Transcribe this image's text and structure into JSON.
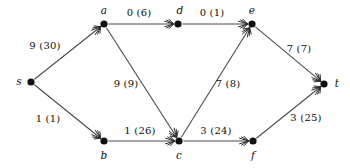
{
  "figure": {
    "kind": "flow-network-diagram",
    "width": 350,
    "height": 168,
    "background": "#ffffff",
    "line_color": "#4a4a4a",
    "node_color": "#111111",
    "text_color": "#0d0d0d"
  },
  "nodes": [
    {
      "id": "s",
      "label": "s",
      "x": 31,
      "y": 82,
      "label_x": 19,
      "label_y": 81,
      "r": 3.6
    },
    {
      "id": "a",
      "label": "a",
      "x": 104,
      "y": 24,
      "label_x": 104,
      "label_y": 10,
      "r": 3.6
    },
    {
      "id": "b",
      "label": "b",
      "x": 104,
      "y": 141,
      "label_x": 104,
      "label_y": 155,
      "r": 3.6
    },
    {
      "id": "d",
      "label": "d",
      "x": 178,
      "y": 24,
      "label_x": 180,
      "label_y": 10,
      "r": 3.6
    },
    {
      "id": "c",
      "label": "c",
      "x": 179,
      "y": 141,
      "label_x": 179,
      "label_y": 155,
      "r": 3.6
    },
    {
      "id": "e",
      "label": "e",
      "x": 252,
      "y": 24,
      "label_x": 252,
      "label_y": 10,
      "r": 3.6
    },
    {
      "id": "f",
      "label": "f",
      "x": 253,
      "y": 141,
      "label_x": 253,
      "label_y": 155,
      "r": 3.6
    },
    {
      "id": "t",
      "label": "t",
      "x": 324,
      "y": 84,
      "label_x": 337,
      "label_y": 83,
      "r": 3.6
    }
  ],
  "edges": [
    {
      "from": "s",
      "to": "a",
      "flow": 9,
      "capacity": 30,
      "label": "9 (30)",
      "label_x": 45,
      "label_y": 45
    },
    {
      "from": "s",
      "to": "b",
      "flow": 1,
      "capacity": 1,
      "label": "1 (1)",
      "label_x": 48,
      "label_y": 118
    },
    {
      "from": "a",
      "to": "d",
      "flow": 0,
      "capacity": 6,
      "label": "0 (6)",
      "label_x": 139,
      "label_y": 12
    },
    {
      "from": "a",
      "to": "c",
      "flow": 9,
      "capacity": 9,
      "label": "9 (9)",
      "label_x": 126,
      "label_y": 83
    },
    {
      "from": "d",
      "to": "e",
      "flow": 0,
      "capacity": 1,
      "label": "0 (1)",
      "label_x": 212,
      "label_y": 12
    },
    {
      "from": "b",
      "to": "c",
      "flow": 1,
      "capacity": 26,
      "label": "1 (26)",
      "label_x": 140,
      "label_y": 130
    },
    {
      "from": "c",
      "to": "e",
      "flow": 7,
      "capacity": 8,
      "label": "7 (8)",
      "label_x": 228,
      "label_y": 83
    },
    {
      "from": "c",
      "to": "f",
      "flow": 3,
      "capacity": 24,
      "label": "3 (24)",
      "label_x": 216,
      "label_y": 130
    },
    {
      "from": "e",
      "to": "t",
      "flow": 7,
      "capacity": 7,
      "label": "7 (7)",
      "label_x": 299,
      "label_y": 48
    },
    {
      "from": "f",
      "to": "t",
      "flow": 3,
      "capacity": 25,
      "label": "3 (25)",
      "label_x": 306,
      "label_y": 117
    }
  ]
}
